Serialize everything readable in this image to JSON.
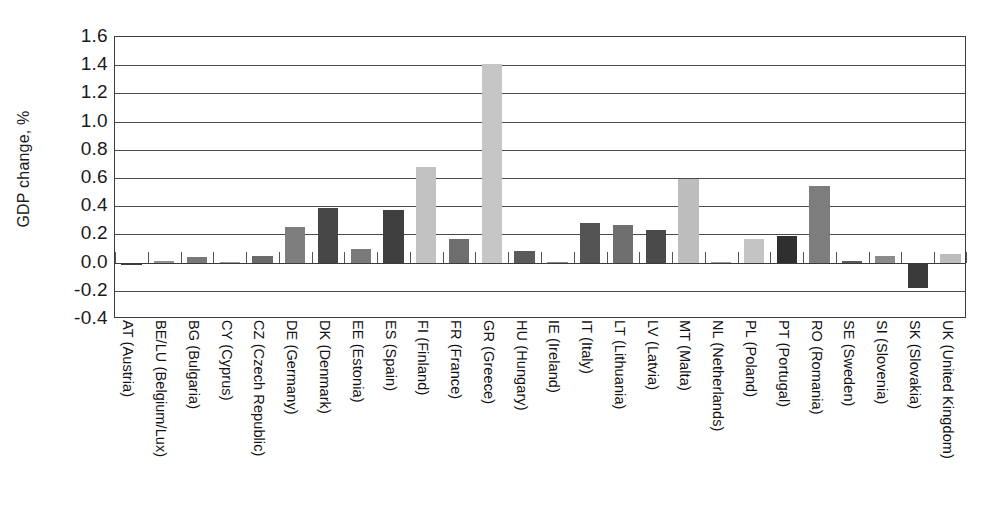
{
  "chart_data": {
    "type": "bar",
    "title": "",
    "xlabel": "",
    "ylabel": "GDP change, %",
    "ylim": [
      -0.4,
      1.6
    ],
    "ytick_step": 0.2,
    "grid": true,
    "legend": "none",
    "yticks": [
      "1.6",
      "1.4",
      "1.2",
      "1.0",
      "0.8",
      "0.6",
      "0.4",
      "0.2",
      "0.0",
      "-0.2",
      "-0.4"
    ],
    "ytick_values": [
      1.6,
      1.4,
      1.2,
      1.0,
      0.8,
      0.6,
      0.4,
      0.2,
      0.0,
      -0.2,
      -0.4
    ],
    "categories": [
      "AT (Austria)",
      "BE/LU (Belgium/Lux)",
      "BG (Bulgaria)",
      "CY (Cyprus)",
      "CZ (Czech Republic)",
      "DE (Germany)",
      "DK (Denmark)",
      "EE (Estonia)",
      "ES (Spain)",
      "FI (Finland)",
      "FR (France)",
      "GR (Greece)",
      "HU (Hungary)",
      "IE (Ireland)",
      "IT (Italy)",
      "LT (Lithuania)",
      "LV (Latvia)",
      "MT (Malta)",
      "NL (Netherlands)",
      "PL (Poland)",
      "PT (Portugal)",
      "RO (Romania)",
      "SE (Sweden)",
      "SI (Slovenia)",
      "SK (Slovakia)",
      "UK (United Kingdom)"
    ],
    "values": [
      -0.015,
      0.012,
      0.042,
      0.004,
      0.05,
      0.25,
      0.39,
      0.1,
      0.37,
      0.68,
      0.17,
      1.41,
      0.08,
      0.004,
      0.28,
      0.27,
      0.23,
      0.59,
      0.004,
      0.17,
      0.19,
      0.54,
      0.012,
      0.05,
      -0.18,
      0.06
    ],
    "bar_colors": [
      "#3d3d3d",
      "#8f8f8f",
      "#787878",
      "#9a9a9a",
      "#6a6a6a",
      "#7e7e7e",
      "#474747",
      "#7a7a7a",
      "#3f3f3f",
      "#c2c2c2",
      "#6e6e6e",
      "#c6c6c6",
      "#5a5a5a",
      "#8a8a8a",
      "#545454",
      "#6f6f6f",
      "#4a4a4a",
      "#bdbdbd",
      "#9a9a9a",
      "#c4c4c4",
      "#2f2f2f",
      "#7d7d7d",
      "#595959",
      "#8b8b8b",
      "#3a3a3a",
      "#bcbcbc"
    ]
  },
  "axis": {
    "y_title": "GDP change, %"
  }
}
